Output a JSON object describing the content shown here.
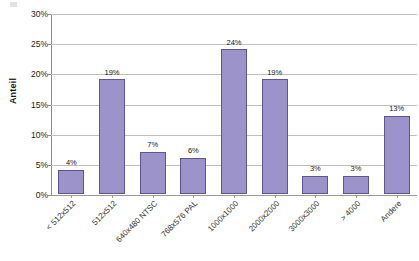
{
  "chart_data": {
    "type": "bar",
    "title": "",
    "subtitle": "",
    "xlabel": "",
    "ylabel": "Anteil",
    "ylim": [
      0,
      30
    ],
    "ytick_labels": [
      "30%",
      "25%",
      "20%",
      "15%",
      "10%",
      "5%",
      "0%"
    ],
    "ytick_values": [
      30,
      25,
      20,
      15,
      10,
      5,
      0
    ],
    "ytick_step": 5,
    "grid": "horizontal",
    "legend": "none",
    "value_suffix": "%",
    "categories": [
      "< 512x512",
      "512x512",
      "640x480 NTSC",
      "768x576 PAL",
      "1000x1000",
      "2000x2000",
      "3000x3000",
      "> 4000",
      "Andere"
    ],
    "values": [
      4,
      19,
      7,
      6,
      24,
      19,
      3,
      3,
      13
    ],
    "data_labels": [
      "4%",
      "19%",
      "7%",
      "6%",
      "24%",
      "19%",
      "3%",
      "3%",
      "13%"
    ],
    "bar_fill_color": "#9b93c9",
    "bar_border_color": "#5e568f",
    "gridline_color": "#c0c0c0",
    "axis_color": "#8c8c8c",
    "background_color": "#ffffff",
    "text_color": "#1a1a1a"
  }
}
